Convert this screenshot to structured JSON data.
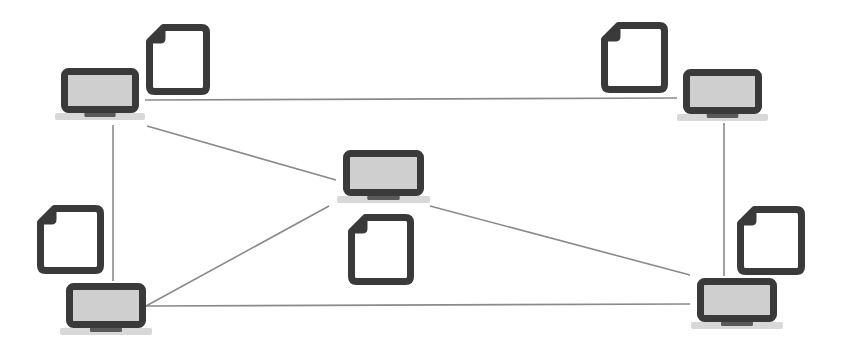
{
  "diagram": {
    "width": 845,
    "height": 352,
    "colors": {
      "background": "#ffffff",
      "outline": "#3a3a3a",
      "screen_fill": "#cfcfcf",
      "base_fill": "#d8d8d8",
      "base_foot": "#5a5a5a",
      "link": "#8a8a8a",
      "doc_fill": "#ffffff"
    },
    "nodes": [
      {
        "id": "laptop-top-left",
        "type": "laptop",
        "x": 61,
        "y": 68,
        "w": 78,
        "h": 45
      },
      {
        "id": "laptop-top-right",
        "type": "laptop",
        "x": 683,
        "y": 69,
        "w": 79,
        "h": 45
      },
      {
        "id": "laptop-center",
        "type": "laptop",
        "x": 343,
        "y": 150,
        "w": 81,
        "h": 46
      },
      {
        "id": "laptop-bottom-left",
        "type": "laptop",
        "x": 66,
        "y": 283,
        "w": 80,
        "h": 45
      },
      {
        "id": "laptop-bottom-right",
        "type": "laptop",
        "x": 697,
        "y": 278,
        "w": 80,
        "h": 44
      }
    ],
    "documents": [
      {
        "id": "doc-top-left",
        "type": "file",
        "x": 146,
        "y": 24,
        "w": 64,
        "h": 71
      },
      {
        "id": "doc-top-right",
        "type": "file",
        "x": 601,
        "y": 22,
        "w": 67,
        "h": 71
      },
      {
        "id": "doc-center",
        "type": "file",
        "x": 348,
        "y": 214,
        "w": 66,
        "h": 71
      },
      {
        "id": "doc-left",
        "type": "file",
        "x": 37,
        "y": 205,
        "w": 67,
        "h": 69
      },
      {
        "id": "doc-right",
        "type": "file",
        "x": 737,
        "y": 206,
        "w": 68,
        "h": 69
      }
    ],
    "links": [
      {
        "id": "link-tl-tr",
        "x1": 145,
        "y1": 100,
        "x2": 677,
        "y2": 98
      },
      {
        "id": "link-tl-c",
        "x1": 147,
        "y1": 126,
        "x2": 336,
        "y2": 180
      },
      {
        "id": "link-tl-bl",
        "x1": 113,
        "y1": 125,
        "x2": 113,
        "y2": 281
      },
      {
        "id": "link-tr-br",
        "x1": 724,
        "y1": 123,
        "x2": 724,
        "y2": 276
      },
      {
        "id": "link-c-bl",
        "x1": 329,
        "y1": 206,
        "x2": 146,
        "y2": 306
      },
      {
        "id": "link-c-br",
        "x1": 430,
        "y1": 206,
        "x2": 690,
        "y2": 275
      },
      {
        "id": "link-bl-br",
        "x1": 146,
        "y1": 306,
        "x2": 690,
        "y2": 304
      }
    ]
  }
}
